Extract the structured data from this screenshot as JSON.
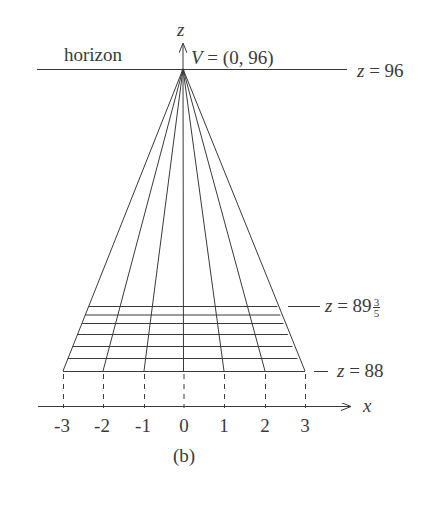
{
  "figure": {
    "caption": "(b)",
    "horizon_label": "horizon",
    "vertex_label": "V = (0, 96)",
    "z_axis_label": "z",
    "x_axis_label": "x",
    "horizon_z_label": "z = 96",
    "top_grid_label_prefix": "z = 89",
    "top_grid_label_frac_num": "3",
    "top_grid_label_frac_den": "5",
    "bottom_grid_label": "z = 88",
    "x_ticks": [
      "-3",
      "-2",
      "-1",
      "0",
      "1",
      "2",
      "3"
    ],
    "colors": {
      "line": "#3a3a3a",
      "text": "#3a3a3a",
      "background": "#ffffff"
    }
  },
  "geometry": {
    "vanishing_point": {
      "x": 0,
      "z": 96
    },
    "ground_near_z": 88,
    "ground_far_z": 89.6,
    "x_range": [
      -3,
      3
    ],
    "grid_columns": 6,
    "grid_rows": 6
  }
}
